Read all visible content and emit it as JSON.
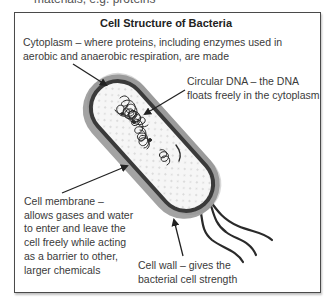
{
  "cutoff_text": "materials, e.g. proteins",
  "diagram": {
    "title": "Cell Structure of Bacteria",
    "labels": {
      "cytoplasm": "Cytoplasm – where proteins, including enzymes used in aerobic and anaerobic respiration, are made",
      "circular_dna": "Circular DNA – the DNA floats freely in the cytoplasm",
      "cell_membrane": "Cell membrane – allows gases and water to enter and leave the cell freely while acting as a barrier to other, larger chemicals",
      "cell_wall": "Cell wall – gives the bacterial cell strength"
    },
    "colors": {
      "cell_wall": "#9a9a9a",
      "membrane": "#3a3a3a",
      "cytoplasm": "#f4f4f4",
      "border": "#4a4a4a"
    }
  }
}
